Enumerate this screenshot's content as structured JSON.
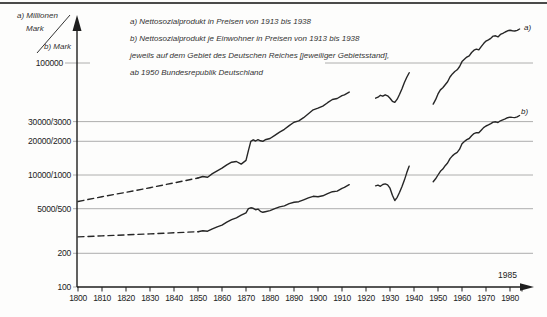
{
  "colors": {
    "curve": "#262626",
    "grid": "#999999",
    "axis": "#1e1e1e",
    "rule": "#4a4a4a"
  },
  "axis_unit_labels": {
    "a_line1": "a) Millionen",
    "a_line2": "Mark",
    "b": "b) Mark"
  },
  "legend": {
    "lines": [
      "a) Nettosozialprodukt in Preisen von 1913 bis 1938",
      "b) Nettosozialprodukt je Einwohner in Preisen von 1913 bis 1938",
      "jeweils auf dem Gebiet des Deutschen Reiches  [jeweiliger Gebietsstand],",
      "ab 1950 Bundesrepublik Deutschland"
    ]
  },
  "annotations": {
    "year_1985": "1985",
    "series_a_end": "a)",
    "series_b_end": "b)"
  },
  "chart_data": {
    "type": "line",
    "title": "",
    "x_axis": {
      "range": [
        1800,
        1988
      ],
      "tick_years": [
        1800,
        1810,
        1820,
        1830,
        1840,
        1850,
        1860,
        1870,
        1880,
        1890,
        1900,
        1910,
        1920,
        1930,
        1940,
        1950,
        1960,
        1970,
        1980
      ],
      "unlabeled_tick_year": 1985,
      "annotation": "1985"
    },
    "y_axis": {
      "scale": "log",
      "unit_a": "Millionen Mark",
      "unit_b": "Mark",
      "ticks": [
        {
          "label": "100000",
          "pos_b": 10000,
          "segments": [
            [
              65,
              90
            ],
            [
              325,
              533
            ]
          ]
        },
        {
          "label": "30000/3000",
          "pos_b": 3000,
          "gridline": true
        },
        {
          "label": "20000/2000",
          "pos_b": 2000,
          "gridline": true
        },
        {
          "label": "10000/1000",
          "pos_b": 1000,
          "gridline": true
        },
        {
          "label": "5000/500",
          "pos_b": 500,
          "gridline": true
        },
        {
          "label": "200",
          "pos_b": 200,
          "gridline": true
        },
        {
          "label": "100",
          "pos_b": 100,
          "gridline": false
        }
      ]
    },
    "series": [
      {
        "name": "a) Nettosozialprodukt",
        "axis": "a",
        "unit": "Millionen Mark",
        "segments": [
          {
            "style": "dashed",
            "points": [
              [
                1800,
                5800
              ],
              [
                1810,
                6400
              ],
              [
                1820,
                7000
              ],
              [
                1830,
                7700
              ],
              [
                1840,
                8500
              ],
              [
                1850,
                9400
              ]
            ]
          },
          {
            "style": "solid",
            "points": [
              [
                1850,
                9400
              ],
              [
                1852,
                9700
              ],
              [
                1854,
                9550
              ],
              [
                1856,
                10300
              ],
              [
                1858,
                10900
              ],
              [
                1860,
                11500
              ],
              [
                1862,
                12300
              ],
              [
                1864,
                13000
              ],
              [
                1866,
                13200
              ],
              [
                1868,
                12500
              ],
              [
                1870,
                13500
              ],
              [
                1871,
                16500
              ],
              [
                1872,
                20000
              ],
              [
                1873,
                20600
              ],
              [
                1874,
                20100
              ],
              [
                1875,
                20700
              ],
              [
                1876,
                20200
              ],
              [
                1877,
                20000
              ],
              [
                1878,
                20600
              ],
              [
                1880,
                21200
              ],
              [
                1882,
                22600
              ],
              [
                1884,
                24100
              ],
              [
                1886,
                25600
              ],
              [
                1888,
                27600
              ],
              [
                1890,
                29600
              ],
              [
                1892,
                30400
              ],
              [
                1894,
                32500
              ],
              [
                1896,
                35200
              ],
              [
                1898,
                38200
              ],
              [
                1900,
                39500
              ],
              [
                1902,
                41200
              ],
              [
                1904,
                44200
              ],
              [
                1906,
                47200
              ],
              [
                1908,
                48200
              ],
              [
                1910,
                51200
              ],
              [
                1911,
                52000
              ],
              [
                1913,
                55000
              ]
            ]
          },
          {
            "style": "solid",
            "points": [
              [
                1924,
                48500
              ],
              [
                1925,
                49500
              ],
              [
                1926,
                51500
              ],
              [
                1927,
                50500
              ],
              [
                1928,
                52000
              ],
              [
                1929,
                51000
              ],
              [
                1930,
                48500
              ],
              [
                1931,
                45500
              ],
              [
                1932,
                44500
              ],
              [
                1933,
                47500
              ],
              [
                1934,
                52500
              ],
              [
                1935,
                59000
              ],
              [
                1936,
                67000
              ],
              [
                1937,
                74500
              ],
              [
                1938,
                82000
              ]
            ]
          },
          {
            "style": "solid",
            "points": [
              [
                1948,
                43000
              ],
              [
                1949,
                47000
              ],
              [
                1950,
                53000
              ],
              [
                1951,
                57500
              ],
              [
                1952,
                60000
              ],
              [
                1953,
                64000
              ],
              [
                1954,
                68000
              ],
              [
                1955,
                75000
              ],
              [
                1956,
                80000
              ],
              [
                1957,
                84000
              ],
              [
                1958,
                87000
              ],
              [
                1959,
                93000
              ],
              [
                1960,
                103000
              ],
              [
                1961,
                108000
              ],
              [
                1962,
                113000
              ],
              [
                1963,
                116000
              ],
              [
                1964,
                124000
              ],
              [
                1965,
                130000
              ],
              [
                1966,
                133000
              ],
              [
                1967,
                131000
              ],
              [
                1968,
                140000
              ],
              [
                1969,
                149000
              ],
              [
                1970,
                157000
              ],
              [
                1971,
                161000
              ],
              [
                1972,
                166000
              ],
              [
                1973,
                174000
              ],
              [
                1974,
                175000
              ],
              [
                1975,
                171000
              ],
              [
                1976,
                180000
              ],
              [
                1977,
                184000
              ],
              [
                1978,
                189000
              ],
              [
                1979,
                194000
              ],
              [
                1980,
                196000
              ],
              [
                1981,
                194000
              ],
              [
                1982,
                193000
              ],
              [
                1983,
                196000
              ],
              [
                1984,
                201000
              ]
            ]
          }
        ]
      },
      {
        "name": "b) Nettosozialprodukt je Einwohner",
        "axis": "b",
        "unit": "Mark",
        "segments": [
          {
            "style": "dashed",
            "points": [
              [
                1800,
                280
              ],
              [
                1810,
                286
              ],
              [
                1820,
                292
              ],
              [
                1830,
                298
              ],
              [
                1840,
                305
              ],
              [
                1850,
                312
              ]
            ]
          },
          {
            "style": "solid",
            "points": [
              [
                1850,
                312
              ],
              [
                1852,
                318
              ],
              [
                1854,
                315
              ],
              [
                1856,
                330
              ],
              [
                1858,
                345
              ],
              [
                1860,
                356
              ],
              [
                1862,
                380
              ],
              [
                1864,
                400
              ],
              [
                1866,
                415
              ],
              [
                1868,
                438
              ],
              [
                1870,
                460
              ],
              [
                1871,
                500
              ],
              [
                1872,
                510
              ],
              [
                1873,
                504
              ],
              [
                1874,
                490
              ],
              [
                1875,
                496
              ],
              [
                1876,
                474
              ],
              [
                1877,
                464
              ],
              [
                1878,
                470
              ],
              [
                1880,
                481
              ],
              [
                1882,
                500
              ],
              [
                1884,
                519
              ],
              [
                1886,
                530
              ],
              [
                1888,
                556
              ],
              [
                1890,
                570
              ],
              [
                1892,
                578
              ],
              [
                1894,
                600
              ],
              [
                1896,
                626
              ],
              [
                1898,
                646
              ],
              [
                1900,
                640
              ],
              [
                1902,
                652
              ],
              [
                1904,
                682
              ],
              [
                1906,
                710
              ],
              [
                1908,
                718
              ],
              [
                1910,
                760
              ],
              [
                1911,
                775
              ],
              [
                1913,
                820
              ]
            ]
          },
          {
            "style": "solid",
            "points": [
              [
                1924,
                800
              ],
              [
                1925,
                812
              ],
              [
                1926,
                792
              ],
              [
                1927,
                822
              ],
              [
                1928,
                832
              ],
              [
                1929,
                816
              ],
              [
                1930,
                762
              ],
              [
                1931,
                660
              ],
              [
                1932,
                592
              ],
              [
                1933,
                632
              ],
              [
                1934,
                700
              ],
              [
                1935,
                790
              ],
              [
                1936,
                900
              ],
              [
                1937,
                1050
              ],
              [
                1938,
                1200
              ]
            ]
          },
          {
            "style": "solid",
            "points": [
              [
                1948,
                870
              ],
              [
                1949,
                925
              ],
              [
                1950,
                1000
              ],
              [
                1951,
                1080
              ],
              [
                1952,
                1130
              ],
              [
                1953,
                1210
              ],
              [
                1954,
                1280
              ],
              [
                1955,
                1400
              ],
              [
                1956,
                1480
              ],
              [
                1957,
                1545
              ],
              [
                1958,
                1590
              ],
              [
                1959,
                1700
              ],
              [
                1960,
                1900
              ],
              [
                1961,
                1990
              ],
              [
                1962,
                2070
              ],
              [
                1963,
                2120
              ],
              [
                1964,
                2240
              ],
              [
                1965,
                2340
              ],
              [
                1966,
                2390
              ],
              [
                1967,
                2380
              ],
              [
                1968,
                2510
              ],
              [
                1969,
                2650
              ],
              [
                1970,
                2740
              ],
              [
                1971,
                2800
              ],
              [
                1972,
                2870
              ],
              [
                1973,
                2970
              ],
              [
                1974,
                2985
              ],
              [
                1975,
                2940
              ],
              [
                1976,
                3050
              ],
              [
                1977,
                3110
              ],
              [
                1978,
                3170
              ],
              [
                1979,
                3250
              ],
              [
                1980,
                3290
              ],
              [
                1981,
                3270
              ],
              [
                1982,
                3255
              ],
              [
                1983,
                3300
              ],
              [
                1984,
                3400
              ]
            ]
          }
        ]
      }
    ]
  }
}
